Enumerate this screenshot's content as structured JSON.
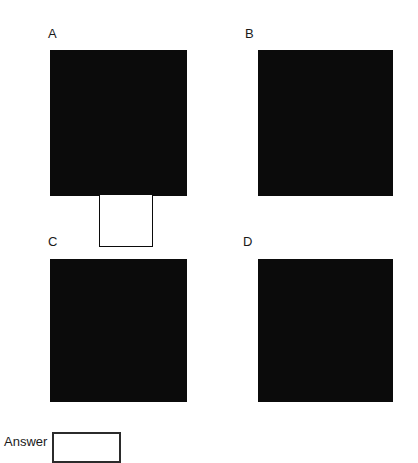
{
  "question": {
    "type": "visual-multiple-choice",
    "options": [
      {
        "id": "A",
        "label": "A",
        "outer_shape": "filled-square",
        "outer_color": "#0b0b0b",
        "inner_shape": "square",
        "inner_color": "#ffffff",
        "inner_position": "bottom-left-corner"
      },
      {
        "id": "B",
        "label": "B",
        "outer_shape": "filled-square",
        "outer_color": "#0b0b0b",
        "inner_shape": "square",
        "inner_color": "#ffffff",
        "inner_position": "top-left-corner"
      },
      {
        "id": "C",
        "label": "C",
        "outer_shape": "filled-square",
        "outer_color": "#0b0b0b",
        "inner_shape": "square",
        "inner_color": "#ffffff",
        "inner_position": "right-edge-middle"
      },
      {
        "id": "D",
        "label": "D",
        "outer_shape": "filled-square",
        "outer_color": "#0b0b0b",
        "inner_shape": "square",
        "inner_color": "#ffffff",
        "inner_position": "center"
      }
    ]
  },
  "answer": {
    "label": "Answer",
    "value": "",
    "placeholder": ""
  },
  "colors": {
    "background": "#ffffff",
    "ink": "#1a1a1a",
    "fill": "#0b0b0b",
    "box_border": "#2b2b2b"
  }
}
